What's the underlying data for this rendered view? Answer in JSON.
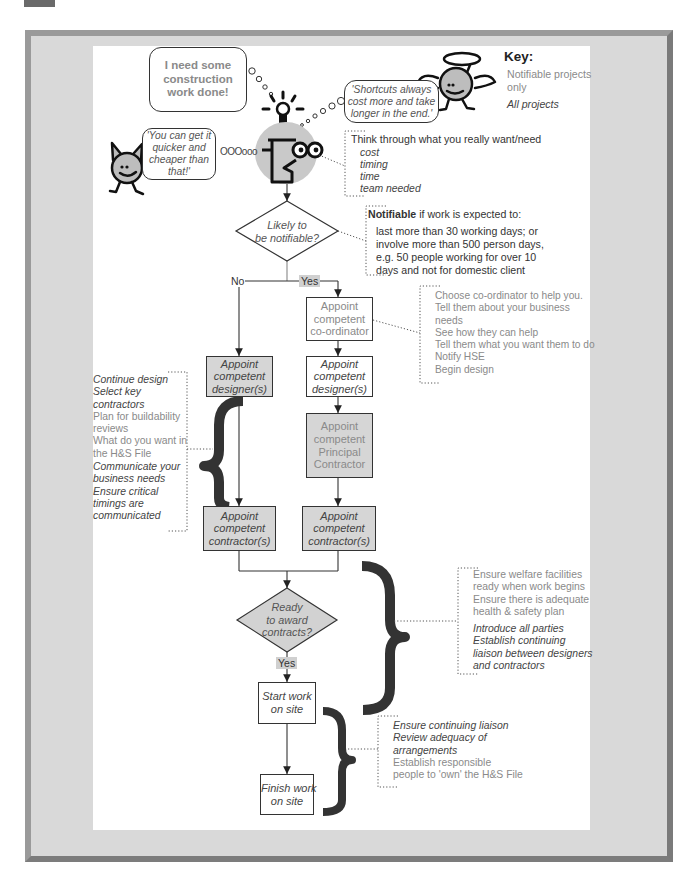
{
  "thoughts": {
    "need": [
      "I need some",
      "construction",
      "work done!"
    ],
    "devil": [
      "'You can get it",
      "quicker and",
      "cheaper than",
      "that!'"
    ],
    "devil_trail": "OOOooo",
    "angel": [
      "'Shortcuts always",
      "cost more and take",
      "longer in the end.'"
    ]
  },
  "key": {
    "title": "Key:",
    "notifiable": [
      "Notifiable projects",
      "only"
    ],
    "all": "All projects"
  },
  "think_note": {
    "heading": "Think through what you really want/need",
    "items": [
      "cost",
      "timing",
      "time",
      "team needed"
    ]
  },
  "notifiable_note": {
    "bold": "Notifiable",
    "rest": " if work is expected to:",
    "lines": [
      "last more than 30 working days; or",
      "involve more than 500 person days,",
      "e.g. 50 people working for over 10",
      "days and not for domestic client"
    ]
  },
  "decision_notifiable": {
    "label": [
      "Likely to",
      "be notifiable?"
    ],
    "no": "No",
    "yes": "Yes"
  },
  "boxes": {
    "coordinator": [
      "Appoint",
      "competent",
      "co-ordinator"
    ],
    "designer_left": [
      "Appoint",
      "competent",
      "designer(s)"
    ],
    "designer_right": [
      "Appoint",
      "competent",
      "designer(s)"
    ],
    "principal_contractor": [
      "Appoint",
      "competent",
      "Principal",
      "Contractor"
    ],
    "contractor_left": [
      "Appoint",
      "competent",
      "contractor(s)"
    ],
    "contractor_right": [
      "Appoint",
      "competent",
      "contractor(s)"
    ],
    "start": [
      "Start work",
      "on site"
    ],
    "finish": [
      "Finish work",
      "on site"
    ]
  },
  "coordinator_note": [
    "Choose co-ordinator to help you.",
    "Tell them about your business",
    "needs",
    "See how they can help",
    "Tell them what you want them to do",
    "Notify HSE",
    "Begin design"
  ],
  "design_note": {
    "all_1": [
      "Continue design",
      "Select key",
      "contractors"
    ],
    "notifiable": [
      "Plan for buildability",
      "reviews",
      "What do you want in",
      "the H&S File"
    ],
    "all_2": [
      "Communicate your",
      "business needs",
      "Ensure critical",
      "timings are",
      "communicated"
    ]
  },
  "decision_award": {
    "label": [
      "Ready",
      "to award",
      "contracts?"
    ],
    "yes": "Yes"
  },
  "award_note": {
    "notifiable": [
      "Ensure welfare facilities",
      "ready when work begins",
      "Ensure there is adequate",
      "health & safety plan"
    ],
    "all": [
      "Introduce all parties",
      "Establish continuing",
      "liaison between designers",
      "and contractors"
    ]
  },
  "site_note": {
    "all": [
      "Ensure continuing liaison",
      "Review adequacy of",
      "arrangements"
    ],
    "notifiable": [
      "Establish responsible",
      "people to 'own' the H&S File"
    ]
  },
  "colors": {
    "frame": "#8e8e8e",
    "frame_fill": "#d9d9d9",
    "grey_box": "#d6d6d6",
    "notifiable_text": "#8a8a8a",
    "all_text": "#444444",
    "brace": "#333333"
  }
}
